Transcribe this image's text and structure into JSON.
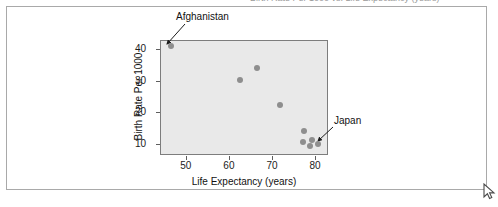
{
  "page": {
    "background_color": "#ffffff",
    "frame_color": "#a9a9a9",
    "cursor": "arrow-cursor",
    "caption_sliver": "Birth Rate Per 1000 vs. Life Expectancy (years)"
  },
  "chart_data": {
    "type": "scatter",
    "title": "",
    "xlabel": "Life Expectancy (years)",
    "ylabel": "Birth Rate Per 1000",
    "xlim": [
      44,
      83
    ],
    "ylim": [
      6.5,
      43
    ],
    "xticks": [
      50,
      60,
      70,
      80
    ],
    "yticks": [
      10,
      20,
      30,
      40
    ],
    "grid": false,
    "legend": "none",
    "point_color": "#8e8e8e",
    "panel_color": "#e9e9e9",
    "points": [
      {
        "x": 46.5,
        "y": 41.0,
        "label": "Afghanistan"
      },
      {
        "x": 62.5,
        "y": 30.2,
        "label": ""
      },
      {
        "x": 66.6,
        "y": 34.0,
        "label": ""
      },
      {
        "x": 71.9,
        "y": 22.3,
        "label": ""
      },
      {
        "x": 77.4,
        "y": 14.0,
        "label": ""
      },
      {
        "x": 77.2,
        "y": 10.7,
        "label": ""
      },
      {
        "x": 78.9,
        "y": 9.3,
        "label": ""
      },
      {
        "x": 79.4,
        "y": 11.3,
        "label": ""
      },
      {
        "x": 80.6,
        "y": 10.1,
        "label": "Japan"
      }
    ],
    "annotations": [
      {
        "text": "Afghanistan",
        "points_to": {
          "x": 46.5,
          "y": 41.0
        }
      },
      {
        "text": "Japan",
        "points_to": {
          "x": 80.6,
          "y": 10.1
        }
      }
    ]
  }
}
